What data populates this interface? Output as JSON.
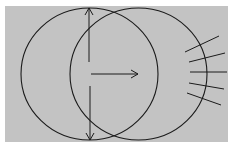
{
  "diagram": {
    "colors": {
      "background": "#c3c3c3",
      "stroke": "#1a1a1a",
      "border": "#ffffff"
    },
    "circles": [
      {
        "name": "left-circle",
        "cx": 89.5,
        "cy": 74,
        "rx": 68.5,
        "ry": 66
      },
      {
        "name": "right-circle",
        "cx": 138.5,
        "cy": 74,
        "rx": 68.5,
        "ry": 66
      }
    ],
    "arrows": [
      {
        "name": "up-arrow",
        "from": [
          89,
          62
        ],
        "to": [
          89,
          8
        ]
      },
      {
        "name": "down-arrow",
        "from": [
          90,
          86
        ],
        "to": [
          90,
          140
        ]
      },
      {
        "name": "right-arrow",
        "from": [
          91,
          74
        ],
        "to": [
          138,
          74
        ]
      }
    ],
    "tick_lines": [
      {
        "x1": 185,
        "y1": 52,
        "x2": 219,
        "y2": 36
      },
      {
        "x1": 189,
        "y1": 62,
        "x2": 225,
        "y2": 53
      },
      {
        "x1": 190,
        "y1": 72,
        "x2": 227,
        "y2": 72
      },
      {
        "x1": 189,
        "y1": 83,
        "x2": 224,
        "y2": 89
      },
      {
        "x1": 187,
        "y1": 93,
        "x2": 221,
        "y2": 105
      }
    ]
  }
}
